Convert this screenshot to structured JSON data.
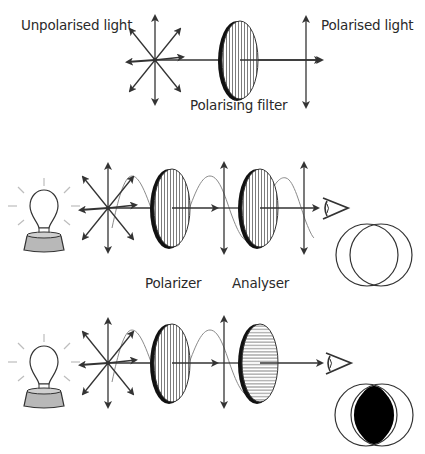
{
  "labels": {
    "unpolarised": "Unpolarised light",
    "polarised": "Polarised light",
    "polarising_filter": "Polarising filter",
    "polarizer": "Polarizer",
    "analyser": "Analyser"
  },
  "colors": {
    "ink": "#333333",
    "wave": "#8a8a8a",
    "bulb_base": "#b8b8b8",
    "rays": "#bdbdbd",
    "dark": "#000000"
  },
  "panels": [
    {
      "id": "single-filter",
      "description": "Unpolarised light passes through one polarising filter and becomes polarised"
    },
    {
      "id": "parallel-filters",
      "description": "Polarizer and analyser with parallel axes; light passes; circles overlap clear"
    },
    {
      "id": "crossed-filters",
      "description": "Polarizer and analyser crossed; light blocked; overlap region dark"
    }
  ]
}
